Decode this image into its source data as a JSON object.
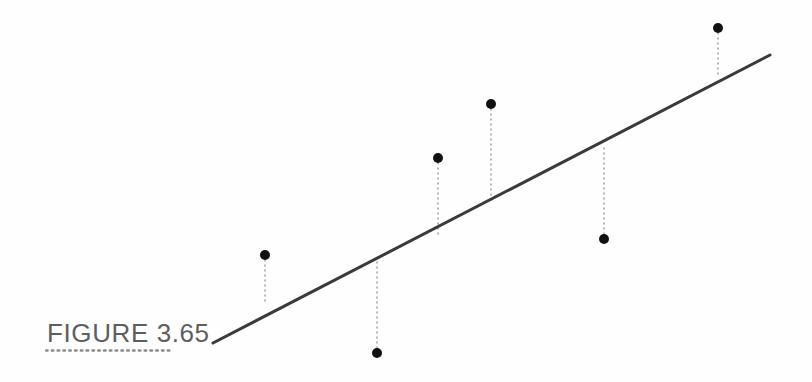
{
  "figure": {
    "caption": "FIGURE 3.65",
    "caption_color": "#5e5e5e",
    "rule_color": "#8a8a8a",
    "background_color": "#fefefe"
  },
  "chart_data": {
    "type": "scatter",
    "title": "FIGURE 3.65",
    "subtitle": "",
    "xlabel": "",
    "ylabel": "",
    "grid": false,
    "legend": null,
    "axes_visible": false,
    "tick_labels": [],
    "annotations": [],
    "xlim": [
      0,
      812
    ],
    "ylim": [
      382,
      0
    ],
    "series": [
      {
        "name": "Data points",
        "type": "scatter",
        "marker": "filled-circle",
        "marker_size": 10,
        "color": "#111111",
        "points": [
          {
            "id": "p1",
            "x": 265,
            "y": 255,
            "fit_y": 305,
            "residual": 50,
            "residual_sign": "positive"
          },
          {
            "id": "p2",
            "x": 377,
            "y": 353,
            "fit_y": 262,
            "residual": -91,
            "residual_sign": "negative"
          },
          {
            "id": "p3",
            "x": 438,
            "y": 158,
            "fit_y": 235,
            "residual": 77,
            "residual_sign": "positive"
          },
          {
            "id": "p4",
            "x": 491,
            "y": 104,
            "fit_y": 200,
            "residual": 96,
            "residual_sign": "positive"
          },
          {
            "id": "p5",
            "x": 604,
            "y": 239,
            "fit_y": 147,
            "residual": -92,
            "residual_sign": "negative"
          },
          {
            "id": "p6",
            "x": 718,
            "y": 28,
            "fit_y": 78,
            "residual": 50,
            "residual_sign": "positive"
          }
        ]
      },
      {
        "name": "Regression line",
        "type": "line",
        "color": "#3a3a3a",
        "width": 3,
        "x0": 213,
        "y0": 343,
        "x1": 770,
        "y1": 55
      },
      {
        "name": "Residual segments",
        "type": "dotted-vertical",
        "color": "#a8a8a8",
        "width": 1.6,
        "dash": "1 4"
      }
    ]
  }
}
